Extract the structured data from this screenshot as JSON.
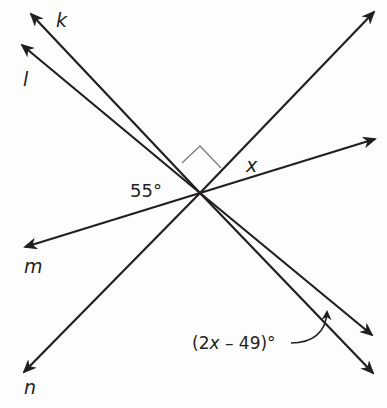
{
  "figure": {
    "type": "intersecting lines diagram",
    "intersection_point": "single common vertex"
  },
  "lines": [
    {
      "name": "k",
      "label": "k"
    },
    {
      "name": "l",
      "label": "l"
    },
    {
      "name": "m",
      "label": "m"
    },
    {
      "name": "n",
      "label": "n"
    }
  ],
  "angles": {
    "left_angle": "55°",
    "unknown_angle": "x",
    "expression_angle": "(2x – 49)°",
    "expression_prefix": "(2",
    "expression_var": "x",
    "expression_suffix": " – 49)°",
    "right_angle_marker": true
  },
  "colors": {
    "line": "#231f20",
    "right_angle_marker": "#808080",
    "background": "#fdfdfd"
  }
}
